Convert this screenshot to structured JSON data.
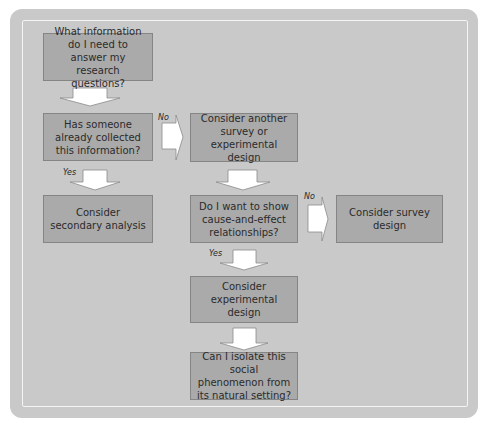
{
  "flowchart": {
    "nodes": [
      {
        "id": "q1",
        "text": "What information do I need to answer my research questions?"
      },
      {
        "id": "q2",
        "text": "Has someone already collected this information?"
      },
      {
        "id": "a1",
        "text": "Consider another survey or experimental design"
      },
      {
        "id": "a2",
        "text": "Consider secondary analysis"
      },
      {
        "id": "q3",
        "text": "Do I want to show cause-and-effect relationships?"
      },
      {
        "id": "a3",
        "text": "Consider survey design"
      },
      {
        "id": "a4",
        "text": "Consider experimental design"
      },
      {
        "id": "q4",
        "text": "Can I isolate this social phenomenon from its natural setting?"
      }
    ],
    "edges": [
      {
        "from": "q1",
        "to": "q2",
        "label": ""
      },
      {
        "from": "q2",
        "to": "a1",
        "label": "No"
      },
      {
        "from": "q2",
        "to": "a2",
        "label": "Yes"
      },
      {
        "from": "a1",
        "to": "q3",
        "label": ""
      },
      {
        "from": "q3",
        "to": "a3",
        "label": "No"
      },
      {
        "from": "q3",
        "to": "a4",
        "label": "Yes"
      },
      {
        "from": "a4",
        "to": "q4",
        "label": ""
      }
    ]
  },
  "colors": {
    "panel": "#c9c9c9",
    "box": "#aaaaaa",
    "box_border": "#858585",
    "arrow_fill": "#ffffff",
    "text": "#2b2b2b"
  }
}
